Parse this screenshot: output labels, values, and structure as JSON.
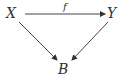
{
  "diagram": {
    "type": "commutative-triangle",
    "nodes": {
      "X": {
        "label": "X"
      },
      "Y": {
        "label": "Y"
      },
      "B": {
        "label": "B"
      }
    },
    "edges": [
      {
        "from": "X",
        "to": "Y",
        "label": "f"
      },
      {
        "from": "X",
        "to": "B",
        "label": ""
      },
      {
        "from": "Y",
        "to": "B",
        "label": ""
      }
    ],
    "colors": {
      "ink": "#333333",
      "background": "#ffffff"
    }
  }
}
